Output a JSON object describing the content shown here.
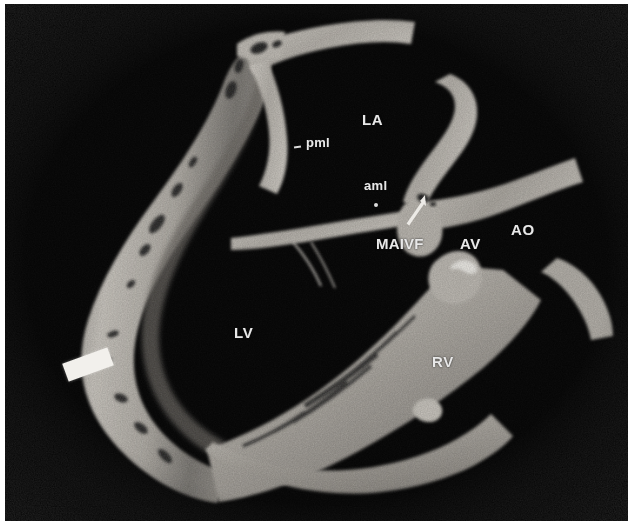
{
  "image": {
    "kind": "gross-pathology-photograph",
    "subject": "human heart long-axis section",
    "modality": "black-and-white specimen photograph",
    "background_color": "#050505",
    "tissue_color": "#b9b6b0",
    "label_color": "#e8e8e8",
    "border_color": "#ffffff"
  },
  "labels": {
    "la": "LA",
    "lv": "LV",
    "rv": "RV",
    "ao": "AO",
    "av": "AV",
    "maivf": "MAIVF",
    "pml": "pml",
    "aml": "aml"
  },
  "annotations": {
    "arrow": "arrow pointing up-right at the mitral-aortic intervalvular fibrosa",
    "pml_dash": "tick mark beside pml",
    "aml_dot": "dot marking the anterior mitral leaflet",
    "scale_marker": "white rectangular marker block on the left ventricular wall"
  }
}
